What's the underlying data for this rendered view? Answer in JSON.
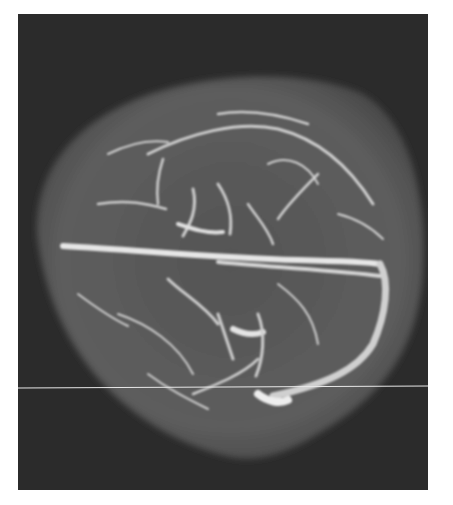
{
  "image": {
    "subject": "MR venography of the brain, axial maximum intensity projection",
    "colors": {
      "background": "#ffffff",
      "frame": "#2b2b2b",
      "head": "#5a5a5a",
      "vessel": "#d8d8d8",
      "scan_line": "#e8e8e8"
    },
    "frame": {
      "x": 18,
      "y": 14,
      "width": 410,
      "height": 476
    },
    "scan_line_y": 388
  }
}
